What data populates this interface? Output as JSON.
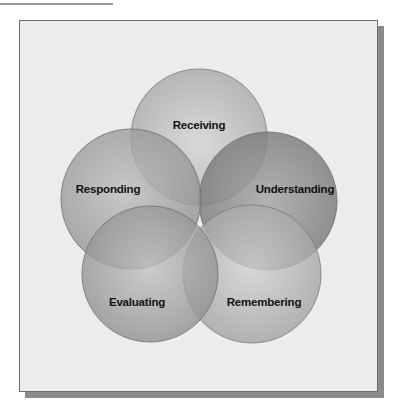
{
  "diagram": {
    "type": "overlapping-circles",
    "circles": [
      {
        "label": "Receiving",
        "cx": 199,
        "cy": 137,
        "r": 68,
        "shade": "#bdbdbd"
      },
      {
        "label": "Responding",
        "cx": 131,
        "cy": 199,
        "r": 70,
        "shade": "#a8a8a8"
      },
      {
        "label": "Understanding",
        "cx": 268,
        "cy": 201,
        "r": 69,
        "shade": "#8f8f8f"
      },
      {
        "label": "Evaluating",
        "cx": 150,
        "cy": 274,
        "r": 68,
        "shade": "#a4a4a4"
      },
      {
        "label": "Remembering",
        "cx": 252,
        "cy": 274,
        "r": 69,
        "shade": "#b8b8b8"
      }
    ],
    "labels": {
      "receiving": "Receiving",
      "responding": "Responding",
      "understanding": "Understanding",
      "evaluating": "Evaluating",
      "remembering": "Remembering"
    }
  },
  "colors": {
    "frame_background": "#ececec",
    "frame_border": "#6b6b6b",
    "shadow": "#8a8a8a",
    "label_text": "#111111"
  }
}
